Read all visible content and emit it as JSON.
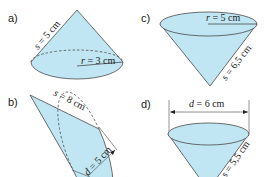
{
  "colors": {
    "fill": "#bfe6f2",
    "stroke": "#4a4a4a",
    "text": "#222222"
  },
  "figures": [
    {
      "id": "a",
      "label": "a)",
      "orientation": "apex-up",
      "measures": [
        {
          "var": "s",
          "text": "s = 5 cm",
          "value": 5,
          "unit": "cm",
          "kind": "slant height"
        },
        {
          "var": "r",
          "text": "r = 3 cm",
          "value": 3,
          "unit": "cm",
          "kind": "radius"
        }
      ]
    },
    {
      "id": "b",
      "label": "b)",
      "orientation": "apex-left-tilted",
      "measures": [
        {
          "var": "s",
          "text": "s = 8 cm",
          "value": 8,
          "unit": "cm",
          "kind": "slant height"
        },
        {
          "var": "d",
          "text": "d = 5 cm",
          "value": 5,
          "unit": "cm",
          "kind": "diameter"
        }
      ]
    },
    {
      "id": "c",
      "label": "c)",
      "orientation": "apex-down",
      "measures": [
        {
          "var": "r",
          "text": "r = 5 cm",
          "value": 5,
          "unit": "cm",
          "kind": "radius"
        },
        {
          "var": "s",
          "text": "s = 6,5 cm",
          "value": 6.5,
          "unit": "cm",
          "kind": "slant height"
        }
      ]
    },
    {
      "id": "d",
      "label": "d)",
      "orientation": "apex-down",
      "measures": [
        {
          "var": "d",
          "text": "d = 6 cm",
          "value": 6,
          "unit": "cm",
          "kind": "diameter"
        },
        {
          "var": "s",
          "text": "s = 5,5 cm",
          "value": 5.5,
          "unit": "cm",
          "kind": "slant height"
        }
      ]
    }
  ]
}
